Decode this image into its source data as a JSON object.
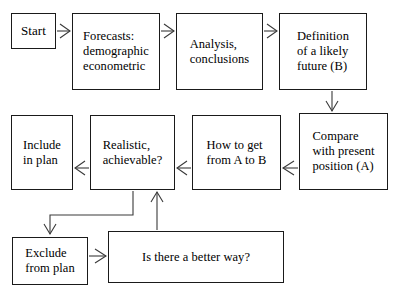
{
  "diagram": {
    "style": {
      "box_stroke": "#1a1a1a",
      "box_fill": "#ffffff",
      "connector_stroke": "#3a3a3a",
      "text_color": "#000000",
      "background": "#ffffff",
      "arrowhead": "open-v"
    },
    "nodes": [
      {
        "id": "start",
        "label": "Start",
        "x": 11,
        "y": 13,
        "w": 45,
        "h": 36,
        "align": "center"
      },
      {
        "id": "forecasts",
        "label": "Forecasts:\ndemographic\neconometric",
        "x": 72,
        "y": 13,
        "w": 88,
        "h": 77,
        "align": "left"
      },
      {
        "id": "analysis",
        "label": "Analysis,\nconclusions",
        "x": 176,
        "y": 13,
        "w": 87,
        "h": 77,
        "align": "left"
      },
      {
        "id": "definition",
        "label": "Definition\nof a likely\nfuture (B)",
        "x": 279,
        "y": 13,
        "w": 88,
        "h": 77,
        "align": "left"
      },
      {
        "id": "compare",
        "label": "Compare\nwith present\nposition (A)",
        "x": 299,
        "y": 113,
        "w": 89,
        "h": 77,
        "align": "left"
      },
      {
        "id": "howto",
        "label": "How to get\nfrom A to B",
        "x": 192,
        "y": 115,
        "w": 89,
        "h": 75,
        "align": "left"
      },
      {
        "id": "realistic",
        "label": "Realistic,\nachievable?",
        "x": 90,
        "y": 115,
        "w": 85,
        "h": 75,
        "align": "left"
      },
      {
        "id": "include",
        "label": "Include\nin plan",
        "x": 11,
        "y": 115,
        "w": 62,
        "h": 75,
        "align": "left"
      },
      {
        "id": "exclude",
        "label": "Exclude\nfrom plan",
        "x": 12,
        "y": 237,
        "w": 76,
        "h": 48,
        "align": "left"
      },
      {
        "id": "better",
        "label": "Is there a better way?",
        "x": 108,
        "y": 231,
        "w": 176,
        "h": 52,
        "align": "center"
      }
    ],
    "edges": [
      {
        "id": "start-to-forecasts",
        "from": "start",
        "to": "forecasts",
        "direction": "right"
      },
      {
        "id": "forecasts-to-analysis",
        "from": "forecasts",
        "to": "analysis",
        "direction": "right"
      },
      {
        "id": "analysis-to-definition",
        "from": "analysis",
        "to": "definition",
        "direction": "right"
      },
      {
        "id": "definition-to-compare",
        "from": "definition",
        "to": "compare",
        "direction": "down"
      },
      {
        "id": "compare-to-howto",
        "from": "compare",
        "to": "howto",
        "direction": "left"
      },
      {
        "id": "howto-to-realistic",
        "from": "howto",
        "to": "realistic",
        "direction": "left"
      },
      {
        "id": "realistic-to-include",
        "from": "realistic",
        "to": "include",
        "direction": "left"
      },
      {
        "id": "realistic-to-exclude",
        "from": "realistic",
        "to": "exclude",
        "direction": "down-left-elbow"
      },
      {
        "id": "exclude-to-better",
        "from": "exclude",
        "to": "better",
        "direction": "right"
      },
      {
        "id": "better-to-realistic",
        "from": "better",
        "to": "realistic",
        "direction": "up"
      }
    ]
  }
}
